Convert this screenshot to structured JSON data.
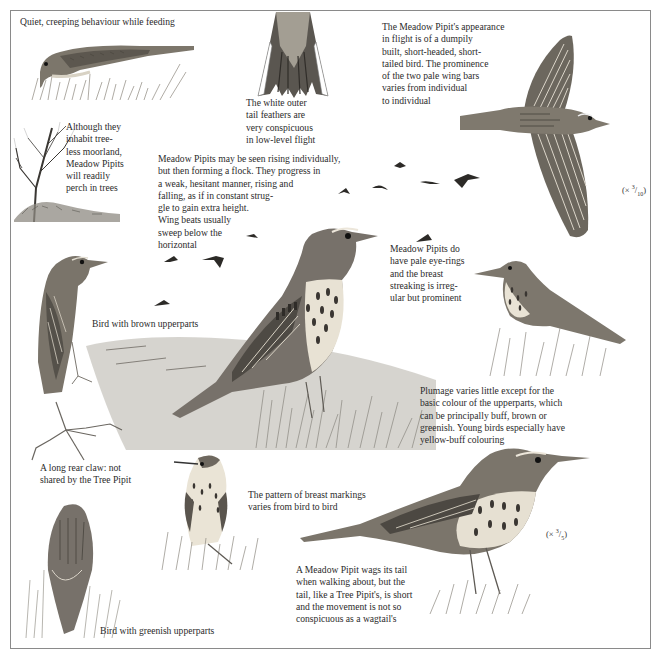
{
  "plate": {
    "subject": "Meadow Pipit",
    "captions": {
      "feeding": "Quiet, creeping behaviour while feeding",
      "tail": "The white outer\ntail feathers are\nvery conspicuous\nin low-level flight",
      "flight_appearance": "The Meadow Pipit's appearance\nin flight is of a dumpily\nbuilt, short-headed, short-\ntailed bird. The prominence\nof the two pale wing bars\nvaries from individual\nto individual",
      "trees": "Although they\ninhabit tree-\nless moorland,\nMeadow Pipits\nwill readily\nperch in trees",
      "flock": "Meadow Pipits may be seen rising individually,\nbut then forming a flock. They progress in\na weak, hesitant manner, rising and\nfalling, as if in constant strug-\ngle to gain extra height.\nWing beats usually\nsweep below the\nhorizontal",
      "eye_rings": "Meadow Pipits do\nhave pale eye-rings\nand the breast\nstreaking is irreg-\nular but prominent",
      "brown": "Bird with brown upperparts",
      "plumage": "Plumage varies little except for the\nbasic colour of the upperparts, which\ncan be principally buff, brown or\ngreenish. Young birds especially have\nyellow-buff colouring",
      "claw": "A long rear claw: not\nshared by the Tree Pipit",
      "breast_pattern": "The pattern of breast markings\nvaries from bird to bird",
      "wagging": "A Meadow Pipit wags its tail\nwhen walking about, but the\ntail, like a Tree Pipit's, is short\nand the movement is not so\nconspicuous as a wagtail's",
      "greenish": "Bird with greenish upperparts"
    },
    "scales": {
      "flight": {
        "prefix": "(×",
        "num": "3",
        "den": "10",
        "suffix": ")"
      },
      "standing": {
        "prefix": "(×",
        "num": "3",
        "den": "5",
        "suffix": ")"
      }
    },
    "illustrations": [
      "feeding-bird",
      "tail-feathers",
      "flying-bird-top-view",
      "bare-tree",
      "flock-silhouettes",
      "brown-bird-perched",
      "main-standing-bird",
      "small-bird-in-grass",
      "rear-claw-foot",
      "greenish-bird-back-view",
      "front-facing-bird",
      "wagging-bird"
    ],
    "colors": {
      "ink": "#2b2b2b",
      "frame": "#8a8a8a",
      "plumage_dark": "#4a4640",
      "plumage_mid": "#8d877c",
      "plumage_light": "#c9c3b6",
      "grass": "#7d7d76"
    }
  }
}
